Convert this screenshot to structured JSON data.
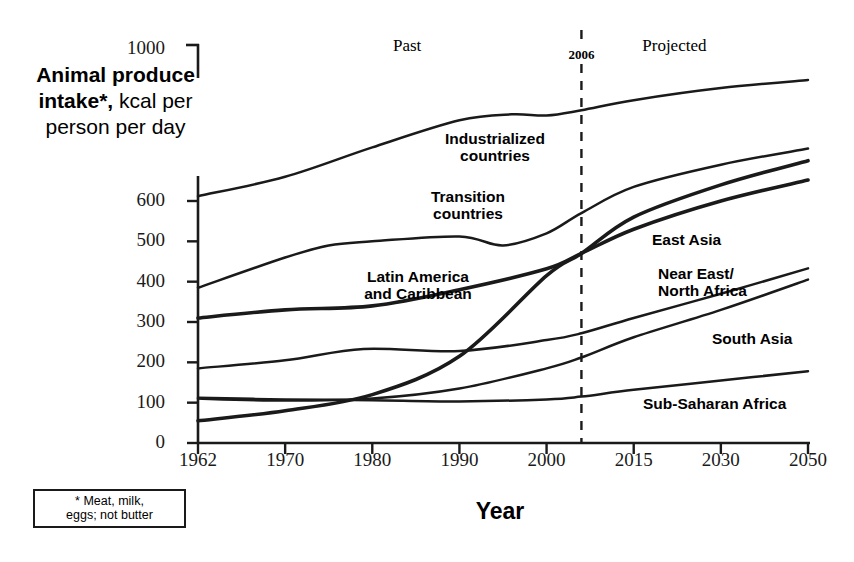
{
  "chart_data": {
    "type": "line",
    "title": "",
    "ylabel_rich": {
      "bold": "Animal produce intake*,",
      "rest": " kcal per person per day"
    },
    "ylabel": "Animal produce intake*, kcal per person per day",
    "xlabel": "Year",
    "footnote": "* Meat, milk,\neggs; not butter",
    "x_ticks": [
      "1962",
      "1970",
      "1980",
      "1990",
      "2000",
      "2015",
      "2030",
      "2050"
    ],
    "y_ticks": [
      "0",
      "100",
      "200",
      "300",
      "400",
      "500",
      "600",
      "1000"
    ],
    "ylim": [
      0,
      600
    ],
    "axis_break_note": "y-axis breaks between 600 and 1000",
    "grid": false,
    "legend_position": "inline-labels",
    "period_labels": [
      {
        "label": "Past",
        "x_year": 1984
      },
      {
        "label": "Projected",
        "x_year": 2022
      }
    ],
    "marker_line": {
      "label": "2006",
      "x_year": 2006,
      "style": "dashed"
    },
    "series": [
      {
        "name": "Industrialized countries",
        "label_x_year": 1988,
        "points": [
          {
            "year": 1962,
            "value": 612
          },
          {
            "year": 1970,
            "value": 660
          },
          {
            "year": 1980,
            "value": 733
          },
          {
            "year": 1990,
            "value": 800
          },
          {
            "year": 1996,
            "value": 815
          },
          {
            "year": 2000,
            "value": 812
          },
          {
            "year": 2006,
            "value": 825
          },
          {
            "year": 2015,
            "value": 850
          },
          {
            "year": 2030,
            "value": 880
          },
          {
            "year": 2050,
            "value": 900
          }
        ]
      },
      {
        "name": "Transition countries",
        "label_x_year": 1986,
        "points": [
          {
            "year": 1962,
            "value": 385
          },
          {
            "year": 1970,
            "value": 460
          },
          {
            "year": 1975,
            "value": 490
          },
          {
            "year": 1980,
            "value": 500
          },
          {
            "year": 1990,
            "value": 512
          },
          {
            "year": 1995,
            "value": 490
          },
          {
            "year": 2000,
            "value": 520
          },
          {
            "year": 2006,
            "value": 570
          },
          {
            "year": 2015,
            "value": 635
          },
          {
            "year": 2030,
            "value": 690
          },
          {
            "year": 2050,
            "value": 730
          }
        ]
      },
      {
        "name": "Latin America and Caribbean",
        "label_x_year": 1982,
        "points": [
          {
            "year": 1962,
            "value": 310
          },
          {
            "year": 1970,
            "value": 330
          },
          {
            "year": 1980,
            "value": 340
          },
          {
            "year": 1990,
            "value": 380
          },
          {
            "year": 2000,
            "value": 432
          },
          {
            "year": 2006,
            "value": 470
          },
          {
            "year": 2015,
            "value": 530
          },
          {
            "year": 2030,
            "value": 600
          },
          {
            "year": 2050,
            "value": 652
          }
        ]
      },
      {
        "name": "East Asia",
        "label_x_year": 2010,
        "points": [
          {
            "year": 1962,
            "value": 55
          },
          {
            "year": 1970,
            "value": 80
          },
          {
            "year": 1980,
            "value": 120
          },
          {
            "year": 1990,
            "value": 215
          },
          {
            "year": 2000,
            "value": 415
          },
          {
            "year": 2006,
            "value": 470
          },
          {
            "year": 2015,
            "value": 560
          },
          {
            "year": 2030,
            "value": 640
          },
          {
            "year": 2050,
            "value": 700
          }
        ]
      },
      {
        "name": "Near East/North Africa",
        "label_x_year": 2009,
        "points": [
          {
            "year": 1962,
            "value": 185
          },
          {
            "year": 1970,
            "value": 205
          },
          {
            "year": 1979,
            "value": 233
          },
          {
            "year": 1990,
            "value": 228
          },
          {
            "year": 2000,
            "value": 255
          },
          {
            "year": 2006,
            "value": 272
          },
          {
            "year": 2015,
            "value": 310
          },
          {
            "year": 2030,
            "value": 370
          },
          {
            "year": 2050,
            "value": 433
          }
        ]
      },
      {
        "name": "South Asia",
        "label_x_year": 2022,
        "points": [
          {
            "year": 1962,
            "value": 110
          },
          {
            "year": 1970,
            "value": 105
          },
          {
            "year": 1980,
            "value": 110
          },
          {
            "year": 1990,
            "value": 135
          },
          {
            "year": 2000,
            "value": 185
          },
          {
            "year": 2006,
            "value": 212
          },
          {
            "year": 2015,
            "value": 262
          },
          {
            "year": 2030,
            "value": 330
          },
          {
            "year": 2050,
            "value": 405
          }
        ]
      },
      {
        "name": "Sub-Saharan Africa",
        "label_x_year": 2023,
        "points": [
          {
            "year": 1962,
            "value": 112
          },
          {
            "year": 1970,
            "value": 108
          },
          {
            "year": 1980,
            "value": 106
          },
          {
            "year": 1990,
            "value": 103
          },
          {
            "year": 2000,
            "value": 108
          },
          {
            "year": 2006,
            "value": 115
          },
          {
            "year": 2015,
            "value": 132
          },
          {
            "year": 2030,
            "value": 155
          },
          {
            "year": 2050,
            "value": 178
          }
        ]
      }
    ],
    "series_labels": [
      {
        "name": "Industrialized countries",
        "lines": [
          "Industrialized",
          "countries"
        ],
        "x": 495,
        "y": 130,
        "align": "center"
      },
      {
        "name": "Transition countries",
        "lines": [
          "Transition",
          "countries"
        ],
        "x": 468,
        "y": 188,
        "align": "center"
      },
      {
        "name": "Latin America and Caribbean",
        "lines": [
          "Latin America",
          "and Caribbean"
        ],
        "x": 418,
        "y": 268,
        "align": "center"
      },
      {
        "name": "East Asia",
        "lines": [
          "East Asia"
        ],
        "x": 652,
        "y": 231,
        "align": "left"
      },
      {
        "name": "Near East/North Africa",
        "lines": [
          "Near East/",
          "North Africa"
        ],
        "x": 658,
        "y": 265,
        "align": "left"
      },
      {
        "name": "South Asia",
        "lines": [
          "South Asia"
        ],
        "x": 712,
        "y": 330,
        "align": "left"
      },
      {
        "name": "Sub-Saharan Africa",
        "lines": [
          "Sub-Saharan Africa"
        ],
        "x": 643,
        "y": 395,
        "align": "left"
      }
    ],
    "colors": {
      "line": "#1a1a1a",
      "axis": "#1a1a1a",
      "background": "#ffffff"
    }
  }
}
